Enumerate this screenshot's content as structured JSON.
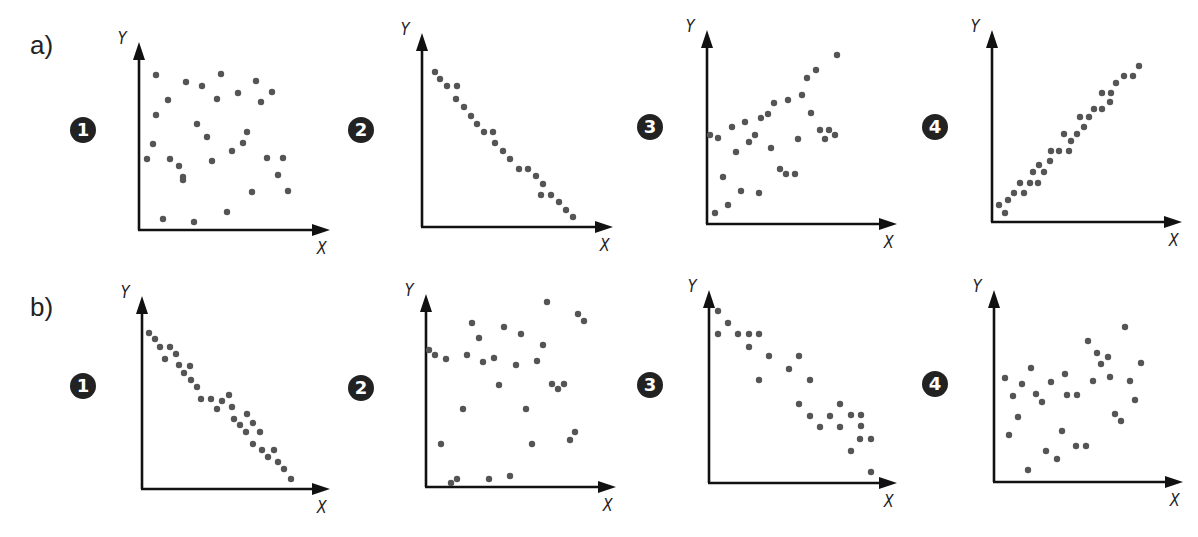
{
  "labels": {
    "row_a": "a)",
    "row_b": "b)",
    "x_axis": "X",
    "y_axis": "Y"
  },
  "colors": {
    "axis": "#111111",
    "point": "#555555",
    "badge": "#222222"
  },
  "chart_data": [
    {
      "type": "scatter",
      "row": "a",
      "index": 1,
      "badge": "1",
      "xlabel": "X",
      "ylabel": "Y",
      "correlation": "none",
      "layout": {
        "origin": [
          139,
          230
        ],
        "yTop": 42,
        "xEnd": 330,
        "badge_pos": [
          70,
          117
        ]
      },
      "points": [
        [
          17,
          155
        ],
        [
          47,
          148
        ],
        [
          63,
          144
        ],
        [
          82,
          156
        ],
        [
          117,
          149
        ],
        [
          99,
          137
        ],
        [
          133,
          138
        ],
        [
          29,
          130
        ],
        [
          78,
          131
        ],
        [
          122,
          128
        ],
        [
          17,
          115
        ],
        [
          58,
          106
        ],
        [
          68,
          93
        ],
        [
          108,
          98
        ],
        [
          14,
          86
        ],
        [
          104,
          87
        ],
        [
          93,
          79
        ],
        [
          8,
          71
        ],
        [
          31,
          71
        ],
        [
          40,
          64
        ],
        [
          73,
          69
        ],
        [
          128,
          72
        ],
        [
          144,
          72
        ],
        [
          44,
          53
        ],
        [
          44,
          50
        ],
        [
          139,
          55
        ],
        [
          113,
          38
        ],
        [
          149,
          39
        ],
        [
          88,
          18
        ],
        [
          24,
          11
        ],
        [
          55,
          8
        ]
      ]
    },
    {
      "type": "scatter",
      "row": "a",
      "index": 2,
      "badge": "2",
      "xlabel": "X",
      "ylabel": "Y",
      "correlation": "strong negative",
      "layout": {
        "origin": [
          422,
          227
        ],
        "yTop": 33,
        "xEnd": 613,
        "badge_pos": [
          348,
          117
        ]
      },
      "points": [
        [
          13,
          155
        ],
        [
          18,
          148
        ],
        [
          25,
          141
        ],
        [
          35,
          141
        ],
        [
          34,
          128
        ],
        [
          42,
          120
        ],
        [
          49,
          111
        ],
        [
          55,
          103
        ],
        [
          62,
          95
        ],
        [
          71,
          95
        ],
        [
          73,
          84
        ],
        [
          81,
          76
        ],
        [
          88,
          68
        ],
        [
          97,
          58
        ],
        [
          106,
          58
        ],
        [
          114,
          51
        ],
        [
          121,
          43
        ],
        [
          119,
          32
        ],
        [
          129,
          32
        ],
        [
          137,
          25
        ],
        [
          144,
          17
        ],
        [
          151,
          10
        ]
      ]
    },
    {
      "type": "scatter",
      "row": "a",
      "index": 3,
      "badge": "3",
      "xlabel": "X",
      "ylabel": "Y",
      "correlation": "weak positive",
      "layout": {
        "origin": [
          707,
          224
        ],
        "yTop": 30,
        "xEnd": 897,
        "badge_pos": [
          637,
          114
        ]
      },
      "points": [
        [
          130,
          169
        ],
        [
          109,
          154
        ],
        [
          100,
          146
        ],
        [
          95,
          129
        ],
        [
          81,
          124
        ],
        [
          67,
          121
        ],
        [
          61,
          110
        ],
        [
          54,
          106
        ],
        [
          104,
          111
        ],
        [
          38,
          102
        ],
        [
          25,
          97
        ],
        [
          3,
          89
        ],
        [
          11,
          86
        ],
        [
          48,
          89
        ],
        [
          42,
          82
        ],
        [
          29,
          72
        ],
        [
          64,
          76
        ],
        [
          91,
          85
        ],
        [
          113,
          94
        ],
        [
          122,
          94
        ],
        [
          118,
          85
        ],
        [
          128,
          89
        ],
        [
          73,
          55
        ],
        [
          79,
          50
        ],
        [
          88,
          50
        ],
        [
          16,
          47
        ],
        [
          34,
          33
        ],
        [
          52,
          31
        ],
        [
          21,
          19
        ],
        [
          8,
          11
        ]
      ]
    },
    {
      "type": "scatter",
      "row": "a",
      "index": 4,
      "badge": "4",
      "xlabel": "X",
      "ylabel": "Y",
      "correlation": "strong positive",
      "layout": {
        "origin": [
          992,
          222
        ],
        "yTop": 30,
        "xEnd": 1182,
        "badge_pos": [
          922,
          114
        ]
      },
      "points": [
        [
          147,
          156
        ],
        [
          141,
          146
        ],
        [
          132,
          146
        ],
        [
          124,
          139
        ],
        [
          110,
          129
        ],
        [
          119,
          129
        ],
        [
          118,
          120
        ],
        [
          110,
          113
        ],
        [
          102,
          113
        ],
        [
          97,
          105
        ],
        [
          88,
          105
        ],
        [
          92,
          95
        ],
        [
          85,
          88
        ],
        [
          72,
          88
        ],
        [
          79,
          81
        ],
        [
          77,
          71
        ],
        [
          67,
          71
        ],
        [
          59,
          71
        ],
        [
          58,
          61
        ],
        [
          52,
          50
        ],
        [
          47,
          57
        ],
        [
          41,
          50
        ],
        [
          38,
          39
        ],
        [
          46,
          39
        ],
        [
          28,
          39
        ],
        [
          32,
          29
        ],
        [
          22,
          29
        ],
        [
          16,
          22
        ],
        [
          7,
          17
        ],
        [
          13,
          9
        ]
      ]
    },
    {
      "type": "scatter",
      "row": "b",
      "index": 1,
      "badge": "1",
      "xlabel": "X",
      "ylabel": "Y",
      "correlation": "strong negative",
      "layout": {
        "origin": [
          142,
          489
        ],
        "yTop": 296,
        "xEnd": 330,
        "badge_pos": [
          70,
          373
        ]
      },
      "points": [
        [
          7,
          156
        ],
        [
          13,
          150
        ],
        [
          18,
          142
        ],
        [
          28,
          142
        ],
        [
          34,
          135
        ],
        [
          23,
          130
        ],
        [
          37,
          124
        ],
        [
          48,
          123
        ],
        [
          42,
          116
        ],
        [
          49,
          109
        ],
        [
          55,
          102
        ],
        [
          59,
          90
        ],
        [
          69,
          90
        ],
        [
          87,
          94
        ],
        [
          80,
          88
        ],
        [
          90,
          82
        ],
        [
          75,
          80
        ],
        [
          105,
          75
        ],
        [
          92,
          70
        ],
        [
          111,
          66
        ],
        [
          98,
          64
        ],
        [
          104,
          57
        ],
        [
          118,
          57
        ],
        [
          111,
          45
        ],
        [
          120,
          39
        ],
        [
          132,
          39
        ],
        [
          126,
          32
        ],
        [
          136,
          27
        ],
        [
          142,
          20
        ],
        [
          149,
          10
        ]
      ]
    },
    {
      "type": "scatter",
      "row": "b",
      "index": 2,
      "badge": "2",
      "xlabel": "X",
      "ylabel": "Y",
      "correlation": "none",
      "layout": {
        "origin": [
          426,
          487
        ],
        "yTop": 294,
        "xEnd": 616,
        "badge_pos": [
          348,
          375
        ]
      },
      "points": [
        [
          121,
          185
        ],
        [
          152,
          173
        ],
        [
          158,
          166
        ],
        [
          46,
          164
        ],
        [
          78,
          160
        ],
        [
          95,
          153
        ],
        [
          53,
          149
        ],
        [
          117,
          142
        ],
        [
          3,
          137
        ],
        [
          9,
          132
        ],
        [
          20,
          128
        ],
        [
          41,
          132
        ],
        [
          57,
          125
        ],
        [
          68,
          129
        ],
        [
          90,
          122
        ],
        [
          111,
          126
        ],
        [
          73,
          102
        ],
        [
          126,
          103
        ],
        [
          132,
          98
        ],
        [
          138,
          103
        ],
        [
          37,
          78
        ],
        [
          100,
          78
        ],
        [
          149,
          55
        ],
        [
          144,
          47
        ],
        [
          15,
          43
        ],
        [
          106,
          43
        ],
        [
          84,
          11
        ],
        [
          63,
          8
        ],
        [
          31,
          8
        ],
        [
          25,
          4
        ]
      ]
    },
    {
      "type": "scatter",
      "row": "b",
      "index": 3,
      "badge": "3",
      "xlabel": "X",
      "ylabel": "Y",
      "correlation": "moderate negative",
      "layout": {
        "origin": [
          709,
          483
        ],
        "yTop": 290,
        "xEnd": 897,
        "badge_pos": [
          637,
          372
        ]
      },
      "points": [
        [
          9,
          172
        ],
        [
          19,
          160
        ],
        [
          9,
          149
        ],
        [
          29,
          149
        ],
        [
          40,
          149
        ],
        [
          50,
          149
        ],
        [
          40,
          136
        ],
        [
          60,
          127
        ],
        [
          90,
          127
        ],
        [
          80,
          114
        ],
        [
          50,
          103
        ],
        [
          101,
          103
        ],
        [
          90,
          79
        ],
        [
          131,
          79
        ],
        [
          101,
          67
        ],
        [
          121,
          67
        ],
        [
          142,
          68
        ],
        [
          152,
          68
        ],
        [
          111,
          56
        ],
        [
          131,
          56
        ],
        [
          152,
          57
        ],
        [
          151,
          44
        ],
        [
          162,
          44
        ],
        [
          142,
          32
        ],
        [
          162,
          11
        ]
      ]
    },
    {
      "type": "scatter",
      "row": "b",
      "index": 4,
      "badge": "4",
      "xlabel": "X",
      "ylabel": "Y",
      "correlation": "weak positive",
      "layout": {
        "origin": [
          994,
          482
        ],
        "yTop": 290,
        "xEnd": 1183,
        "badge_pos": [
          922,
          371
        ]
      },
      "points": [
        [
          131,
          155
        ],
        [
          94,
          141
        ],
        [
          103,
          129
        ],
        [
          114,
          125
        ],
        [
          107,
          118
        ],
        [
          147,
          119
        ],
        [
          37,
          114
        ],
        [
          11,
          104
        ],
        [
          71,
          108
        ],
        [
          116,
          105
        ],
        [
          28,
          98
        ],
        [
          57,
          100
        ],
        [
          99,
          101
        ],
        [
          136,
          101
        ],
        [
          19,
          86
        ],
        [
          42,
          88
        ],
        [
          73,
          87
        ],
        [
          83,
          87
        ],
        [
          48,
          80
        ],
        [
          141,
          82
        ],
        [
          24,
          65
        ],
        [
          121,
          68
        ],
        [
          127,
          61
        ],
        [
          68,
          51
        ],
        [
          15,
          47
        ],
        [
          82,
          36
        ],
        [
          92,
          36
        ],
        [
          52,
          31
        ],
        [
          63,
          23
        ],
        [
          34,
          12
        ]
      ]
    }
  ]
}
